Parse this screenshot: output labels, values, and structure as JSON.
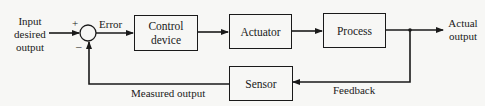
{
  "diagram": {
    "type": "feedback-control-loop",
    "input_label": [
      "Input",
      "desired",
      "output"
    ],
    "plus_sign": "+",
    "minus_sign": "–",
    "error_label": "Error",
    "blocks": {
      "control_device": [
        "Control",
        "device"
      ],
      "actuator": "Actuator",
      "process": "Process",
      "sensor": "Sensor"
    },
    "output_label": [
      "Actual",
      "output"
    ],
    "measured_output_label": "Measured output",
    "feedback_label": "Feedback",
    "colors": {
      "line": "#1a1a1a",
      "background": "#f7f7f5"
    }
  }
}
